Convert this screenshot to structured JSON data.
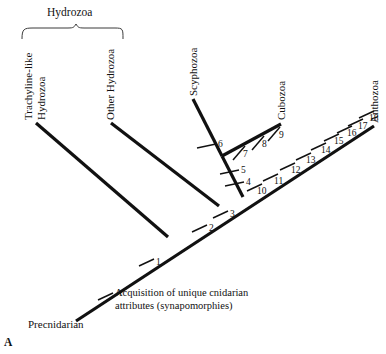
{
  "figure": {
    "panel_label": "A",
    "clade_bracket_label": "Hydrozoa",
    "root_label": "Precnidarian",
    "caption_line_1": "Acquisition of unique cnidarian",
    "caption_line_2": "attributes (synapomorphies)",
    "line_color": "#111111",
    "background_color": "#ffffff"
  },
  "taxa": [
    {
      "name": "trachyline-like-hydrozoa",
      "label_line_1": "Trachyline-like",
      "label_line_2": "Hydrozoa"
    },
    {
      "name": "other-hydrozoa",
      "label_line_1": "Other Hydrozoa",
      "label_line_2": ""
    },
    {
      "name": "scyphozoa",
      "label_line_1": "Scyphozoa",
      "label_line_2": ""
    },
    {
      "name": "cubozoa",
      "label_line_1": "Cubozoa",
      "label_line_2": ""
    },
    {
      "name": "anthozoa",
      "label_line_1": "Anthozoa",
      "label_line_2": ""
    }
  ],
  "character_marks": [
    {
      "number": "1"
    },
    {
      "number": "2"
    },
    {
      "number": "3"
    },
    {
      "number": "4"
    },
    {
      "number": "5"
    },
    {
      "number": "6"
    },
    {
      "number": "7"
    },
    {
      "number": "8"
    },
    {
      "number": "9"
    },
    {
      "number": "10"
    },
    {
      "number": "11"
    },
    {
      "number": "12"
    },
    {
      "number": "13"
    },
    {
      "number": "14"
    },
    {
      "number": "15"
    },
    {
      "number": "16"
    },
    {
      "number": "17"
    },
    {
      "number": "18"
    }
  ]
}
